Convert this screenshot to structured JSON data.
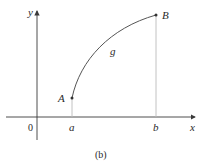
{
  "figure": {
    "caption": "(b)",
    "axes": {
      "x_label": "x",
      "y_label": "y",
      "origin_label": "0"
    },
    "points": [
      {
        "label": "A",
        "x_label": "a"
      },
      {
        "label": "B",
        "x_label": "b"
      }
    ],
    "curve_label": "g",
    "colors": {
      "axis": "#3a3a3a",
      "curve": "#555555",
      "drop_line": "#bbbbbb",
      "point": "#333333"
    }
  }
}
